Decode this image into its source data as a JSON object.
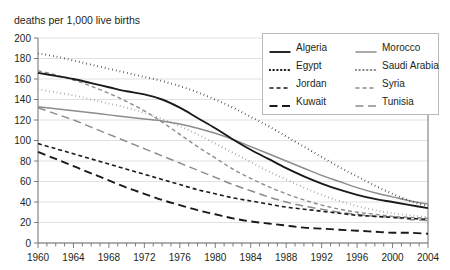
{
  "axis_caption": "deaths per 1,000 live births",
  "legend": {
    "entries": [
      {
        "label": "Algeria",
        "color": "#1a1a1a",
        "dash": "none",
        "width": 1.9
      },
      {
        "label": "Morocco",
        "color": "#8c8c8c",
        "dash": "none",
        "width": 1.5
      },
      {
        "label": "Egypt",
        "color": "#1a1a1a",
        "dash": "dot",
        "width": 2.0
      },
      {
        "label": "Saudi Arabia",
        "color": "#8c8c8c",
        "dash": "dot",
        "width": 2.0
      },
      {
        "label": "Jordan",
        "color": "#1a1a1a",
        "dash": "short",
        "width": 1.6
      },
      {
        "label": "Syria",
        "color": "#8c8c8c",
        "dash": "short",
        "width": 1.4
      },
      {
        "label": "Kuwait",
        "color": "#1a1a1a",
        "dash": "long",
        "width": 1.9
      },
      {
        "label": "Tunisia",
        "color": "#8c8c8c",
        "dash": "long",
        "width": 1.5
      }
    ]
  },
  "chart_data": {
    "type": "line",
    "title": "",
    "xlabel": "",
    "ylabel": "deaths per 1,000 live births",
    "xlim": [
      1960,
      2004
    ],
    "ylim": [
      0,
      200
    ],
    "yticks": [
      0,
      20,
      40,
      60,
      80,
      100,
      120,
      140,
      160,
      180,
      200
    ],
    "xticks": [
      1960,
      1964,
      1968,
      1972,
      1976,
      1980,
      1984,
      1988,
      1992,
      1996,
      2000,
      2004
    ],
    "x_minor_step": 1,
    "grid": true,
    "legend_position": "top-right",
    "x": [
      1960,
      1962,
      1964,
      1966,
      1968,
      1970,
      1972,
      1974,
      1976,
      1978,
      1980,
      1982,
      1984,
      1986,
      1988,
      1990,
      1992,
      1994,
      1996,
      1998,
      2000,
      2002,
      2004
    ],
    "series": [
      {
        "name": "Algeria",
        "values": [
          166,
          163,
          160,
          156,
          152,
          148,
          145,
          140,
          132,
          122,
          112,
          101,
          91,
          82,
          73,
          65,
          58,
          52,
          47,
          43,
          40,
          37,
          34
        ]
      },
      {
        "name": "Egypt",
        "values": [
          185,
          182,
          178,
          174,
          170,
          166,
          162,
          158,
          153,
          147,
          140,
          132,
          123,
          114,
          104,
          94,
          84,
          74,
          65,
          56,
          48,
          41,
          36
        ]
      },
      {
        "name": "Jordan",
        "values": [
          97,
          92,
          87,
          82,
          77,
          72,
          67,
          62,
          57,
          52,
          48,
          44,
          41,
          38,
          35,
          33,
          31,
          29,
          27,
          26,
          25,
          24,
          23
        ]
      },
      {
        "name": "Kuwait",
        "values": [
          89,
          82,
          75,
          68,
          61,
          54,
          48,
          42,
          37,
          32,
          28,
          24,
          21,
          19,
          17,
          15,
          14,
          13,
          12,
          11,
          10,
          10,
          9
        ]
      },
      {
        "name": "Morocco",
        "values": [
          133,
          131,
          129,
          127,
          125,
          123,
          121,
          119,
          116,
          112,
          107,
          101,
          94,
          87,
          80,
          73,
          66,
          60,
          54,
          49,
          45,
          41,
          38
        ]
      },
      {
        "name": "Saudi Arabia",
        "values": [
          150,
          147,
          144,
          140,
          136,
          132,
          127,
          121,
          114,
          106,
          97,
          88,
          79,
          70,
          62,
          54,
          47,
          41,
          36,
          32,
          29,
          27,
          25
        ]
      },
      {
        "name": "Syria",
        "values": [
          168,
          164,
          159,
          153,
          146,
          138,
          129,
          118,
          106,
          94,
          83,
          72,
          63,
          55,
          48,
          42,
          37,
          33,
          30,
          28,
          26,
          25,
          24
        ]
      },
      {
        "name": "Tunisia",
        "values": [
          132,
          126,
          120,
          113,
          106,
          99,
          92,
          85,
          78,
          71,
          64,
          57,
          51,
          45,
          40,
          36,
          33,
          30,
          28,
          26,
          25,
          23,
          22
        ]
      }
    ]
  }
}
